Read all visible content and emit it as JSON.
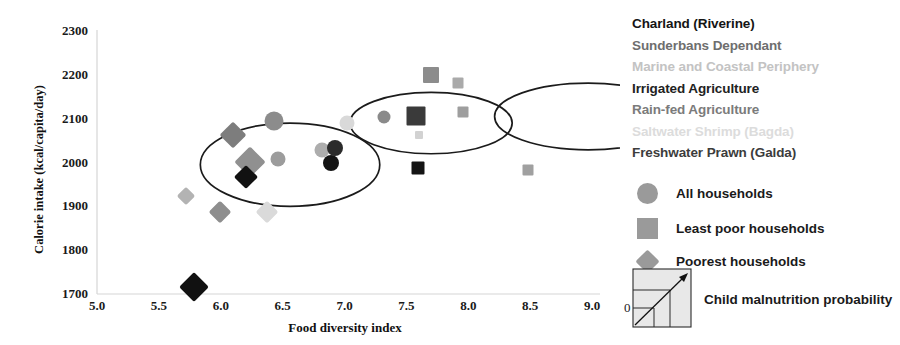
{
  "chart_data": {
    "type": "scatter",
    "title": "",
    "xlabel": "Food diversity index",
    "ylabel": "Calorie intake (kcal/capita/day)",
    "xlim": [
      5.0,
      9.0
    ],
    "ylim": [
      1700,
      2300
    ],
    "xticks": [
      "5.0",
      "5.5",
      "6.0",
      "6.5",
      "7.0",
      "7.5",
      "8.0",
      "8.5",
      "9.0"
    ],
    "yticks": [
      "1700",
      "1800",
      "1900",
      "2000",
      "2100",
      "2200",
      "2300"
    ],
    "grid": false,
    "legend_position": "right",
    "zones": [
      {
        "name": "Charland (Riverine)",
        "color": "#151515",
        "weight": "bold"
      },
      {
        "name": "Sunderbans Dependant",
        "color": "#6e6e6e",
        "weight": "normal"
      },
      {
        "name": "Marine and Coastal Periphery",
        "color": "#c3c3c3",
        "weight": "normal"
      },
      {
        "name": "Irrigated Agriculture",
        "color": "#222222",
        "weight": "bold"
      },
      {
        "name": "Rain-fed Agriculture",
        "color": "#7b7b7b",
        "weight": "normal"
      },
      {
        "name": "Saltwater Shrimp (Bagda)",
        "color": "#dcdcdc",
        "weight": "normal"
      },
      {
        "name": "Freshwater Prawn (Galda)",
        "color": "#3c3c3c",
        "weight": "bold"
      }
    ],
    "marker_legend": [
      {
        "shape": "circle",
        "label": "All households",
        "color": "#9a9a9a"
      },
      {
        "shape": "square",
        "label": "Least poor households",
        "color": "#9a9a9a"
      },
      {
        "shape": "diamond",
        "label": "Poorest households",
        "color": "#9a9a9a"
      }
    ],
    "size_legend": {
      "label": "Child malnutrition probability",
      "min_label": "0"
    },
    "series": [
      {
        "name": "All households",
        "shape": "circle",
        "points": [
          {
            "zone": "Sunderbans Dependant",
            "x": 6.43,
            "y": 2095,
            "size": 19,
            "color": "#8c8c8c"
          },
          {
            "zone": "Rain-fed Agriculture",
            "x": 6.46,
            "y": 2008,
            "size": 15,
            "color": "#9c9c9c"
          },
          {
            "zone": "Saltwater Shrimp (Bagda)",
            "x": 7.02,
            "y": 2091,
            "size": 15,
            "color": "#d9d9d9"
          },
          {
            "zone": "Marine and Coastal Periphery",
            "x": 6.82,
            "y": 2028,
            "size": 15,
            "color": "#adadad"
          },
          {
            "zone": "Irrigated Agriculture",
            "x": 6.92,
            "y": 2032,
            "size": 16,
            "color": "#2b2b2b"
          },
          {
            "zone": "Freshwater Prawn (Galda)",
            "x": 6.89,
            "y": 2000,
            "size": 16,
            "color": "#141414"
          },
          {
            "zone": "Charland (Riverine)",
            "x": 7.32,
            "y": 2103,
            "size": 13,
            "color": "#8a8a8a"
          }
        ]
      },
      {
        "name": "Least poor households",
        "shape": "square",
        "points": [
          {
            "zone": "Sunderbans Dependant",
            "x": 7.7,
            "y": 2200,
            "size": 16,
            "color": "#8c8c8c"
          },
          {
            "zone": "Marine and Coastal Periphery",
            "x": 7.92,
            "y": 2182,
            "size": 11,
            "color": "#aaaaaa"
          },
          {
            "zone": "Rain-fed Agriculture",
            "x": 7.96,
            "y": 2115,
            "size": 11,
            "color": "#9e9e9e"
          },
          {
            "zone": "Irrigated Agriculture",
            "x": 7.58,
            "y": 2107,
            "size": 19,
            "color": "#3a3a3a"
          },
          {
            "zone": "Saltwater Shrimp (Bagda)",
            "x": 7.6,
            "y": 2063,
            "size": 8,
            "color": "#d2d2d2"
          },
          {
            "zone": "Freshwater Prawn (Galda)",
            "x": 7.59,
            "y": 1988,
            "size": 13,
            "color": "#141414"
          },
          {
            "zone": "Charland (Riverine)",
            "x": 8.48,
            "y": 1982,
            "size": 11,
            "color": "#a0a0a0"
          }
        ]
      },
      {
        "name": "Poorest households",
        "shape": "diamond",
        "points": [
          {
            "zone": "Sunderbans Dependant",
            "x": 6.1,
            "y": 2063,
            "size": 19,
            "color": "#7d7d7d"
          },
          {
            "zone": "Rain-fed Agriculture",
            "x": 6.24,
            "y": 2002,
            "size": 22,
            "color": "#909090"
          },
          {
            "zone": "Freshwater Prawn (Galda)",
            "x": 6.2,
            "y": 1966,
            "size": 17,
            "color": "#111111"
          },
          {
            "zone": "Marine and Coastal Periphery",
            "x": 5.72,
            "y": 1923,
            "size": 13,
            "color": "#b3b3b3"
          },
          {
            "zone": "Irrigated Agriculture",
            "x": 5.99,
            "y": 1888,
            "size": 16,
            "color": "#8e8e8e"
          },
          {
            "zone": "Saltwater Shrimp (Bagda)",
            "x": 6.37,
            "y": 1888,
            "size": 16,
            "color": "#dadada"
          },
          {
            "zone": "Charland (Riverine)",
            "x": 5.78,
            "y": 1716,
            "size": 21,
            "color": "#111111"
          }
        ]
      }
    ],
    "cluster_ellipses": [
      {
        "name": "poorest-cluster",
        "cx": 6.56,
        "cy": 1995,
        "rx": 0.725,
        "ry": 95
      },
      {
        "name": "all-households-cluster",
        "cx": 7.7,
        "cy": 2090,
        "rx": 0.655,
        "ry": 70
      },
      {
        "name": "least-poor-cluster",
        "cx": 8.97,
        "cy": 2105,
        "rx": 0.757,
        "ry": 76
      }
    ]
  }
}
